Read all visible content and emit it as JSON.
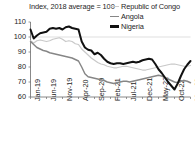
{
  "chart_data": {
    "type": "line",
    "title": "Index, 2018 average = 100",
    "xlabel": "",
    "ylabel": "",
    "ylim": [
      60,
      110
    ],
    "yticks": [
      60,
      70,
      80,
      90,
      100,
      110
    ],
    "grid": "single horizontal gridline at 100",
    "legend_position": "top-right",
    "x_tick_labels": [
      "Jan-19",
      "Jun-19",
      "Nov-19",
      "Apr-20",
      "Sep-20",
      "Feb-21",
      "Jul-21",
      "Dec-21",
      "May-22",
      "Oct-22",
      "Mar-23"
    ],
    "x_tick_indices": [
      0,
      5,
      10,
      15,
      20,
      25,
      30,
      35,
      40,
      45,
      50
    ],
    "x": [
      "Jan-19",
      "Feb-19",
      "Mar-19",
      "Apr-19",
      "May-19",
      "Jun-19",
      "Jul-19",
      "Aug-19",
      "Sep-19",
      "Oct-19",
      "Nov-19",
      "Dec-19",
      "Jan-20",
      "Feb-20",
      "Mar-20",
      "Apr-20",
      "May-20",
      "Jun-20",
      "Jul-20",
      "Aug-20",
      "Sep-20",
      "Oct-20",
      "Nov-20",
      "Dec-20",
      "Jan-21",
      "Feb-21",
      "Mar-21",
      "Apr-21",
      "May-21",
      "Jun-21",
      "Jul-21",
      "Aug-21",
      "Sep-21",
      "Oct-21",
      "Nov-21",
      "Dec-21",
      "Jan-22",
      "Feb-22",
      "Mar-22",
      "Apr-22",
      "May-22",
      "Jun-22",
      "Jul-22",
      "Aug-22",
      "Sep-22",
      "Oct-22",
      "Nov-22",
      "Dec-22",
      "Jan-23",
      "Feb-23",
      "Mar-23"
    ],
    "series": [
      {
        "name": "Republic of Congo",
        "color": "#c9c9c9",
        "values": [
          97.5,
          96.0,
          97.5,
          98.0,
          97.5,
          97.0,
          97.5,
          98.5,
          99.0,
          99.5,
          98.5,
          97.0,
          97.5,
          97.0,
          95.5,
          95.0,
          92.0,
          90.0,
          88.0,
          86.0,
          84.5,
          83.0,
          82.0,
          81.5,
          80.5,
          80.0,
          79.5,
          79.5,
          80.0,
          80.5,
          80.5,
          80.0,
          79.5,
          79.0,
          78.5,
          78.0,
          78.0,
          78.5,
          79.0,
          79.5,
          80.0,
          80.5,
          81.0,
          81.5,
          82.0,
          82.0,
          81.5,
          81.0,
          80.5,
          80.5,
          81.0
        ]
      },
      {
        "name": "Angola",
        "color": "#868686",
        "values": [
          97.0,
          95.0,
          93.0,
          92.0,
          91.0,
          90.5,
          89.5,
          89.0,
          88.5,
          88.0,
          87.5,
          87.0,
          86.5,
          86.0,
          85.0,
          84.0,
          80.0,
          75.5,
          73.5,
          73.0,
          72.5,
          72.0,
          71.5,
          71.0,
          70.0,
          69.5,
          69.0,
          69.5,
          70.0,
          70.5,
          70.5,
          70.0,
          70.5,
          71.0,
          71.5,
          72.0,
          72.5,
          73.0,
          73.5,
          74.0,
          74.5,
          74.0,
          73.0,
          72.0,
          71.0,
          70.0,
          69.5,
          70.5,
          71.0,
          70.5,
          69.5
        ]
      },
      {
        "name": "Nigeria",
        "color": "#111111",
        "values": [
          105.0,
          99.0,
          101.0,
          102.5,
          103.0,
          103.5,
          105.5,
          106.0,
          105.5,
          106.0,
          105.0,
          106.5,
          107.0,
          106.0,
          105.5,
          105.0,
          97.0,
          93.0,
          91.5,
          91.0,
          88.5,
          89.5,
          88.0,
          85.5,
          83.5,
          82.5,
          82.0,
          82.5,
          82.5,
          82.0,
          82.5,
          83.0,
          83.5,
          83.0,
          83.5,
          84.5,
          85.0,
          85.5,
          85.0,
          82.0,
          78.5,
          76.0,
          73.0,
          70.0,
          67.5,
          65.0,
          69.0,
          74.0,
          78.5,
          81.5,
          84.0
        ]
      }
    ]
  }
}
